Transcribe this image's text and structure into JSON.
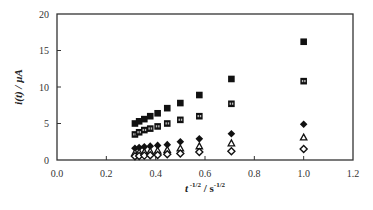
{
  "chart_data": {
    "type": "scatter",
    "title": "",
    "xlabel": "t -1/2 / s-1/2",
    "ylabel": "i(t) / µA",
    "xlim": [
      0.0,
      1.2
    ],
    "ylim": [
      0,
      20
    ],
    "xticks": [
      "0.0",
      "0.2",
      "0.4",
      "0.6",
      "0.8",
      "1.0",
      "1.2"
    ],
    "yticks": [
      "0",
      "5",
      "10",
      "15",
      "20"
    ],
    "grid": false,
    "legend": "none",
    "x": [
      0.316,
      0.333,
      0.354,
      0.378,
      0.408,
      0.447,
      0.5,
      0.577,
      0.707,
      1.0
    ],
    "series": [
      {
        "name": "filled-square",
        "marker": "square-filled",
        "values": [
          5.0,
          5.3,
          5.6,
          6.0,
          6.4,
          7.1,
          7.8,
          8.9,
          11.1,
          16.2
        ]
      },
      {
        "name": "half-filled-square",
        "marker": "square-half",
        "values": [
          3.5,
          3.8,
          4.1,
          4.3,
          4.6,
          5.0,
          5.5,
          6.0,
          7.7,
          10.8
        ]
      },
      {
        "name": "filled-diamond",
        "marker": "diamond-filled",
        "values": [
          1.6,
          1.7,
          1.8,
          1.9,
          2.0,
          2.1,
          2.5,
          2.9,
          3.6,
          4.9
        ]
      },
      {
        "name": "open-triangle",
        "marker": "triangle-open",
        "values": [
          1.0,
          1.05,
          1.1,
          1.2,
          1.3,
          1.4,
          1.6,
          1.9,
          2.3,
          3.1
        ]
      },
      {
        "name": "open-diamond",
        "marker": "diamond-open",
        "values": [
          0.5,
          0.55,
          0.6,
          0.65,
          0.7,
          0.8,
          0.9,
          1.1,
          1.2,
          1.5
        ]
      }
    ]
  },
  "axes": {
    "x_title_main": "t",
    "x_title_exp1": " -1/2",
    "x_title_sep": " / s",
    "x_title_exp2": "-1/2",
    "y_title": "i(t) / µA"
  },
  "colors": {
    "axis": "#333333",
    "marker": "#111111"
  }
}
